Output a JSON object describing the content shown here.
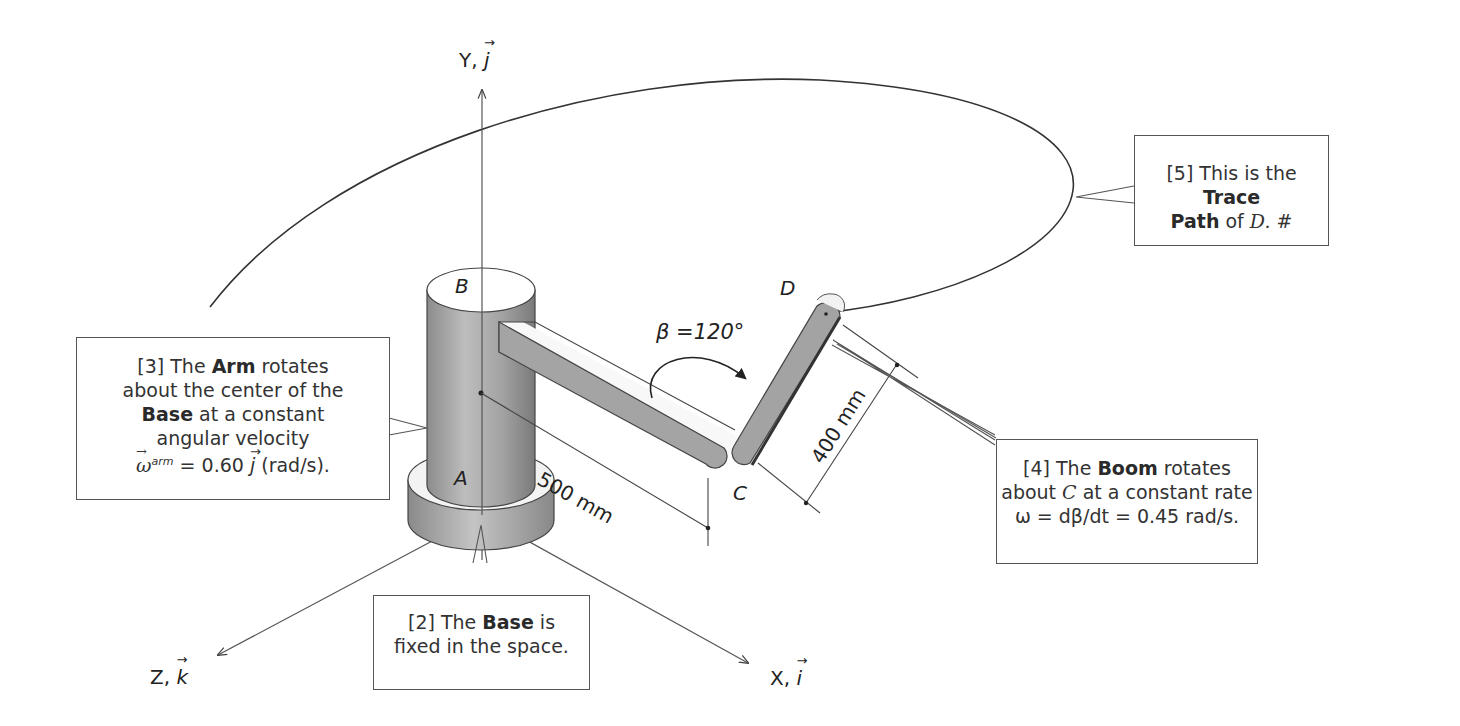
{
  "axes": {
    "y": {
      "letter": "Y,",
      "unit_vector": "j"
    },
    "z": {
      "letter": "Z,",
      "unit_vector": "k"
    },
    "x": {
      "letter": "X,",
      "unit_vector": "i"
    }
  },
  "points": {
    "A": "A",
    "B": "B",
    "C": "C",
    "D": "D"
  },
  "dimensions": {
    "arm_length": "500 mm",
    "boom_length": "400 mm",
    "angle": "β =120°"
  },
  "colors": {
    "line": "#333333",
    "body_gray": "#9a9a9a",
    "body_dark": "#6e6e6e",
    "body_light": "#cfcfcf",
    "callout_border": "#555555"
  },
  "callouts": {
    "c2": {
      "prefix": "[2] The ",
      "bold": "Base",
      "suffix": " is",
      "line2": "fixed in the space."
    },
    "c3": {
      "prefix": "[3] The ",
      "bold": "Arm",
      "suffix": " rotates",
      "line2": "about the center of the",
      "bold3": "Base",
      "line3": " at a constant",
      "line4": "angular velocity",
      "omega": "ω",
      "sup": "arm",
      "eq": " = 0.60 ",
      "vec": "j",
      "unit": " (rad/s)."
    },
    "c4": {
      "prefix": "[4] The ",
      "bold": "Boom",
      "suffix": " rotates",
      "line2a": "about ",
      "line2c": "C",
      "line2b": " at a constant rate",
      "line3": "ω = dβ/dt = 0.45 rad/s."
    },
    "c5": {
      "prefix": "[5] This is the ",
      "bold": "Trace",
      "bold2": "Path",
      "mid": " of ",
      "ital": "D.",
      "suffix": " #"
    }
  }
}
